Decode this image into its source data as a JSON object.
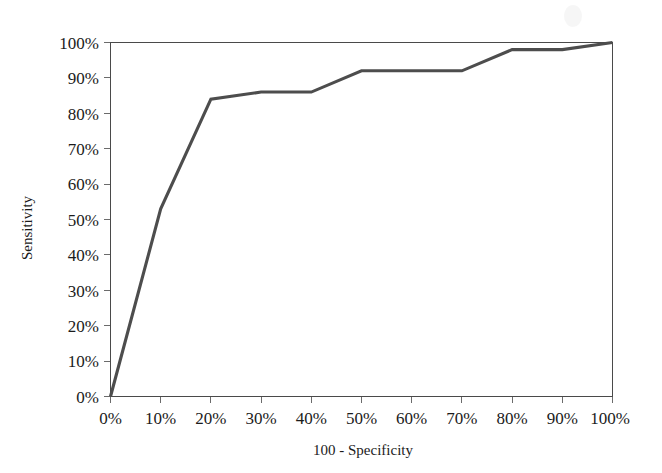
{
  "figure": {
    "background_color": "#ffffff",
    "line_color": "#4d4d4d",
    "axis_color": "#4a4a4a",
    "text_color": "#1b1b1b"
  },
  "chart_data": {
    "type": "line",
    "title": "",
    "xlabel": "100 - Specificity",
    "ylabel": "Sensitivity",
    "xlim": [
      0,
      100
    ],
    "ylim": [
      0,
      100
    ],
    "grid": false,
    "legend": null,
    "x_tick_labels": [
      "0%",
      "10%",
      "20%",
      "30%",
      "40%",
      "50%",
      "60%",
      "70%",
      "80%",
      "90%",
      "100%"
    ],
    "y_tick_labels": [
      "0%",
      "10%",
      "20%",
      "30%",
      "40%",
      "50%",
      "60%",
      "70%",
      "80%",
      "90%",
      "100%"
    ],
    "x_ticks": [
      0,
      10,
      20,
      30,
      40,
      50,
      60,
      70,
      80,
      90,
      100
    ],
    "y_ticks": [
      0,
      10,
      20,
      30,
      40,
      50,
      60,
      70,
      80,
      90,
      100
    ],
    "series": [
      {
        "name": "ROC curve",
        "x": [
          0,
          10,
          20,
          30,
          40,
          50,
          70,
          80,
          90,
          100
        ],
        "y": [
          0,
          53,
          84,
          86,
          86,
          92,
          92,
          98,
          98,
          100
        ]
      }
    ]
  },
  "axis_titles": {
    "x": "100 - Specificity",
    "y": "Sensitivity"
  }
}
